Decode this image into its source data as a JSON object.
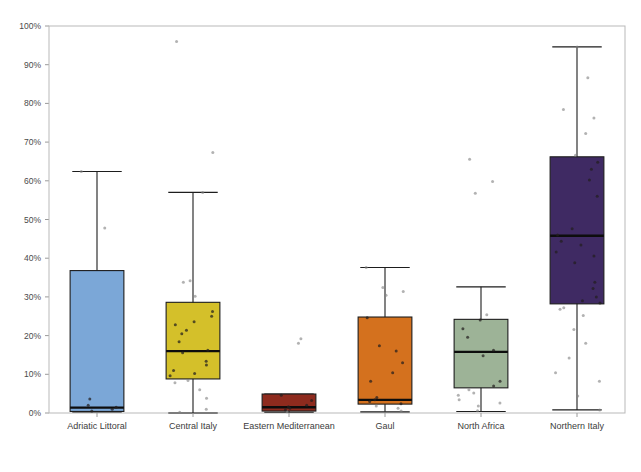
{
  "chart_data": {
    "type": "box",
    "title": "",
    "xlabel": "",
    "ylabel": "",
    "ylim": [
      0,
      100
    ],
    "yunit": "%",
    "grid": false,
    "legend": false,
    "ytick_labels": [
      "0%",
      "10%",
      "20%",
      "30%",
      "40%",
      "50%",
      "60%",
      "70%",
      "80%",
      "90%",
      "100%"
    ],
    "ytick_values": [
      0,
      10,
      20,
      30,
      40,
      50,
      60,
      70,
      80,
      90,
      100
    ],
    "categories": [
      "Adriatic Littoral",
      "Central Italy",
      "Eastern Mediterranean",
      "Gaul",
      "North Africa",
      "Northern Italy"
    ],
    "colors": [
      "#7BA7D7",
      "#D4C02A",
      "#8E2B1E",
      "#D4711E",
      "#9DB397",
      "#3F2A63"
    ],
    "boxes": [
      {
        "category": "Adriatic Littoral",
        "color": "#7BA7D7",
        "whisker_low": 0.3,
        "q1": 0.4,
        "median": 1.4,
        "q3": 36.8,
        "whisker_high": 62.4,
        "points": [
          0.5,
          1.0,
          1.5,
          2.0,
          3.6,
          47.8,
          62.4
        ]
      },
      {
        "category": "Central Italy",
        "color": "#D4C02A",
        "whisker_low": 0.0,
        "q1": 8.8,
        "median": 16.0,
        "q3": 28.6,
        "whisker_high": 57.0,
        "points": [
          0.2,
          1.0,
          3.8,
          6.0,
          7.8,
          8.4,
          9.6,
          10.2,
          11.0,
          12.4,
          13.4,
          15.6,
          16.2,
          18.4,
          20.5,
          21.4,
          22.8,
          23.6,
          25.0,
          26.2,
          30.2,
          33.8,
          34.2,
          57.0,
          67.3,
          96.0
        ]
      },
      {
        "category": "Eastern Mediterranean",
        "color": "#8E2B1E",
        "whisker_low": 0.2,
        "q1": 0.5,
        "median": 1.5,
        "q3": 4.9,
        "whisker_high": 4.9,
        "points": [
          0.3,
          0.8,
          1.2,
          1.6,
          2.0,
          3.2,
          4.6,
          18.0,
          19.2
        ]
      },
      {
        "category": "Gaul",
        "color": "#D4711E",
        "whisker_low": 0.3,
        "q1": 2.3,
        "median": 3.4,
        "q3": 24.8,
        "whisker_high": 37.6,
        "points": [
          0.5,
          1.2,
          1.8,
          2.4,
          3.0,
          3.4,
          4.0,
          8.2,
          10.4,
          13.0,
          16.0,
          17.4,
          24.6,
          30.4,
          31.4,
          32.4,
          37.6
        ]
      },
      {
        "category": "North Africa",
        "color": "#9DB397",
        "whisker_low": 0.4,
        "q1": 6.5,
        "median": 15.8,
        "q3": 24.2,
        "whisker_high": 32.6,
        "points": [
          0.6,
          1.8,
          2.6,
          3.4,
          4.6,
          5.2,
          6.0,
          7.0,
          8.2,
          14.8,
          16.2,
          19.6,
          21.8,
          24.0,
          25.4,
          56.8,
          59.8,
          65.6
        ]
      },
      {
        "category": "Northern Italy",
        "color": "#3F2A63",
        "whisker_low": 0.8,
        "q1": 28.2,
        "median": 45.8,
        "q3": 66.2,
        "whisker_high": 94.6,
        "points": [
          0.8,
          4.4,
          8.2,
          10.4,
          14.2,
          18.0,
          21.6,
          25.2,
          26.8,
          27.2,
          28.4,
          29.0,
          30.0,
          32.2,
          33.8,
          38.8,
          40.6,
          41.6,
          43.4,
          44.4,
          46.0,
          47.6,
          56.0,
          60.2,
          63.0,
          64.8,
          66.6,
          72.2,
          76.2,
          78.4,
          86.6,
          94.6
        ]
      }
    ]
  },
  "axis": {
    "plot_left": 49,
    "plot_right": 625,
    "plot_top": 26,
    "plot_bottom": 413
  }
}
